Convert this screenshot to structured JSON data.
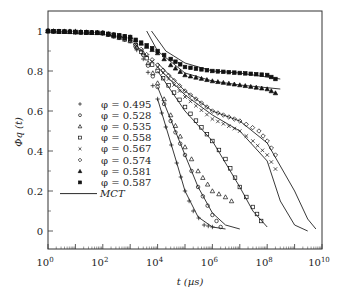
{
  "chart_data": {
    "type": "scatter",
    "title": "",
    "xlabel": "t (µs)",
    "ylabel": "Φq (t)",
    "xscale": "log",
    "xlim": [
      1,
      10000000000
    ],
    "ylim": [
      -0.1,
      1.1
    ],
    "x_tick_labels": [
      "10^0",
      "10^2",
      "10^4",
      "10^6",
      "10^8",
      "10^10"
    ],
    "y_tick_labels": [
      "0",
      "0.2",
      "0.4",
      "0.6",
      "0.8",
      "1"
    ],
    "legend_position": "center-left",
    "grid": false,
    "series": [
      {
        "name": "φ = 0.495",
        "marker": "plus",
        "fill": false,
        "points": [
          [
            1,
            1.0
          ],
          [
            10,
            1.0
          ],
          [
            100,
            0.99
          ],
          [
            1000,
            0.95
          ],
          [
            3000,
            0.86
          ],
          [
            10000,
            0.66
          ],
          [
            20000,
            0.52
          ],
          [
            50000,
            0.34
          ],
          [
            100000,
            0.2
          ],
          [
            200000,
            0.1
          ],
          [
            500000,
            0.03
          ],
          [
            1000000,
            0.02
          ]
        ]
      },
      {
        "name": "φ = 0.528",
        "marker": "circle",
        "fill": false,
        "points": [
          [
            1,
            1.0
          ],
          [
            100,
            0.99
          ],
          [
            1000,
            0.95
          ],
          [
            3000,
            0.88
          ],
          [
            10000,
            0.72
          ],
          [
            30000,
            0.55
          ],
          [
            100000,
            0.38
          ],
          [
            300000,
            0.22
          ],
          [
            1000000,
            0.08
          ],
          [
            2000000,
            0.02
          ]
        ]
      },
      {
        "name": "φ = 0.535",
        "marker": "triangle",
        "fill": false,
        "points": [
          [
            1,
            1.0
          ],
          [
            100,
            0.99
          ],
          [
            1000,
            0.95
          ],
          [
            3000,
            0.89
          ],
          [
            10000,
            0.74
          ],
          [
            30000,
            0.58
          ],
          [
            100000,
            0.42
          ],
          [
            300000,
            0.3
          ],
          [
            1000000,
            0.2
          ],
          [
            3000000,
            0.17
          ],
          [
            5000000,
            0.15
          ]
        ]
      },
      {
        "name": "φ = 0.558",
        "marker": "square",
        "fill": false,
        "points": [
          [
            1,
            1.0
          ],
          [
            100,
            0.99
          ],
          [
            1000,
            0.96
          ],
          [
            10000,
            0.8
          ],
          [
            100000,
            0.62
          ],
          [
            1000000,
            0.45
          ],
          [
            3000000,
            0.36
          ],
          [
            10000000,
            0.22
          ],
          [
            30000000,
            0.12
          ],
          [
            60000000,
            0.05
          ]
        ]
      },
      {
        "name": "φ = 0.567",
        "marker": "cross",
        "fill": false,
        "points": [
          [
            1,
            1.0
          ],
          [
            100,
            0.99
          ],
          [
            1000,
            0.96
          ],
          [
            10000,
            0.82
          ],
          [
            100000,
            0.67
          ],
          [
            1000000,
            0.56
          ],
          [
            10000000,
            0.5
          ],
          [
            30000000,
            0.45
          ],
          [
            100000000,
            0.38
          ],
          [
            200000000,
            0.31
          ]
        ]
      },
      {
        "name": "φ = 0.574",
        "marker": "diamond",
        "fill": false,
        "points": [
          [
            1,
            1.0
          ],
          [
            100,
            0.99
          ],
          [
            1000,
            0.96
          ],
          [
            10000,
            0.83
          ],
          [
            100000,
            0.7
          ],
          [
            1000000,
            0.6
          ],
          [
            10000000,
            0.55
          ],
          [
            50000000,
            0.5
          ],
          [
            100000000,
            0.45
          ],
          [
            200000000,
            0.38
          ]
        ]
      },
      {
        "name": "φ = 0.581",
        "marker": "triangle",
        "fill": true,
        "points": [
          [
            1,
            1.0
          ],
          [
            100,
            0.99
          ],
          [
            1000,
            0.97
          ],
          [
            10000,
            0.89
          ],
          [
            30000,
            0.83
          ],
          [
            100000,
            0.78
          ],
          [
            1000000,
            0.75
          ],
          [
            10000000,
            0.73
          ],
          [
            100000000,
            0.71
          ],
          [
            200000000,
            0.69
          ]
        ]
      },
      {
        "name": "φ = 0.587",
        "marker": "square",
        "fill": true,
        "points": [
          [
            1,
            1.0
          ],
          [
            100,
            0.99
          ],
          [
            1000,
            0.97
          ],
          [
            10000,
            0.9
          ],
          [
            30000,
            0.86
          ],
          [
            100000,
            0.82
          ],
          [
            1000000,
            0.8
          ],
          [
            10000000,
            0.79
          ],
          [
            100000000,
            0.78
          ],
          [
            200000000,
            0.76
          ]
        ]
      }
    ],
    "mct_curves": {
      "name": "MCT",
      "curves": [
        [
          [
            10000,
            0.66
          ],
          [
            50000,
            0.34
          ],
          [
            100000,
            0.2
          ],
          [
            300000,
            0.07
          ],
          [
            1000000,
            0.02
          ],
          [
            3000000,
            0.01
          ]
        ],
        [
          [
            10000,
            0.72
          ],
          [
            100000,
            0.38
          ],
          [
            300000,
            0.22
          ],
          [
            1000000,
            0.09
          ],
          [
            3000000,
            0.03
          ],
          [
            10000000,
            0.01
          ]
        ],
        [
          [
            10000,
            0.8
          ],
          [
            100000,
            0.6
          ],
          [
            1000000,
            0.45
          ],
          [
            10000000,
            0.22
          ],
          [
            30000000,
            0.1
          ],
          [
            100000000,
            0.02
          ]
        ],
        [
          [
            10000,
            0.82
          ],
          [
            100000,
            0.68
          ],
          [
            1000000,
            0.58
          ],
          [
            10000000,
            0.5
          ],
          [
            100000000,
            0.35
          ],
          [
            300000000,
            0.15
          ],
          [
            1000000000,
            0.03
          ],
          [
            3000000000,
            0.0
          ]
        ],
        [
          [
            10000,
            0.84
          ],
          [
            100000,
            0.7
          ],
          [
            1000000,
            0.6
          ],
          [
            10000000,
            0.55
          ],
          [
            100000000,
            0.44
          ],
          [
            1000000000,
            0.2
          ],
          [
            3000000000,
            0.06
          ],
          [
            6000000000,
            0.01
          ]
        ],
        [
          [
            4000,
            1.0
          ],
          [
            10000,
            0.9
          ],
          [
            100000,
            0.79
          ],
          [
            1000000,
            0.75
          ],
          [
            10000000,
            0.73
          ],
          [
            300000000,
            0.71
          ]
        ],
        [
          [
            6000,
            1.0
          ],
          [
            20000,
            0.9
          ],
          [
            100000,
            0.84
          ],
          [
            1000000,
            0.8
          ],
          [
            10000000,
            0.79
          ],
          [
            300000000,
            0.76
          ]
        ]
      ]
    },
    "legend": [
      {
        "label": "φ = 0.495",
        "marker": "plus"
      },
      {
        "label": "φ = 0.528",
        "marker": "circle"
      },
      {
        "label": "φ = 0.535",
        "marker": "triangle-open"
      },
      {
        "label": "φ = 0.558",
        "marker": "square-open"
      },
      {
        "label": "φ = 0.567",
        "marker": "cross"
      },
      {
        "label": "φ = 0.574",
        "marker": "diamond-open"
      },
      {
        "label": "φ = 0.581",
        "marker": "triangle-filled"
      },
      {
        "label": "φ = 0.587",
        "marker": "square-filled"
      },
      {
        "label": "MCT",
        "marker": "line"
      }
    ]
  },
  "labels": {
    "xlabel": "t (µs)",
    "ylabel": "Φq (t)",
    "x_ticks": [
      "10",
      "10",
      "10",
      "10",
      "10",
      "10"
    ],
    "x_exps": [
      "0",
      "2",
      "4",
      "6",
      "8",
      "10"
    ],
    "y_ticks": [
      "0",
      "0.2",
      "0.4",
      "0.6",
      "0.8",
      "1"
    ]
  }
}
